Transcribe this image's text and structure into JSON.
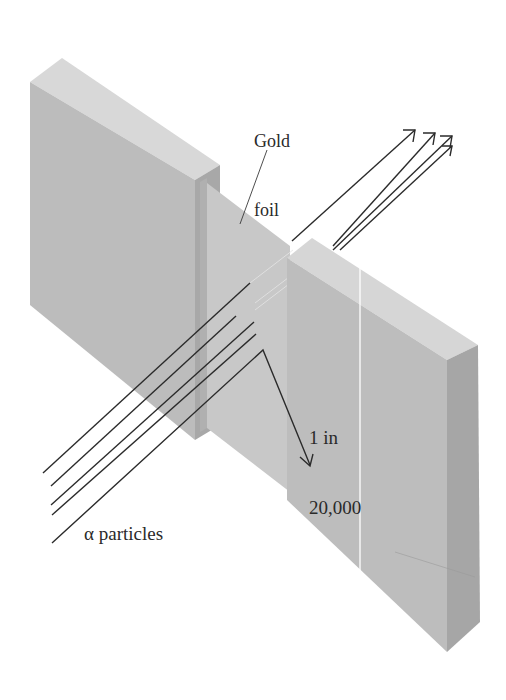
{
  "labels": {
    "gold_foil_line1": "Gold",
    "gold_foil_line2": "foil",
    "ratio_line1": "1 in",
    "ratio_line2": "20,000",
    "alpha": "α particles"
  },
  "colors": {
    "block_front": "#bdbdbd",
    "block_top": "#d6d6d6",
    "block_side": "#a9a9a9",
    "foil": "#c6c6c6",
    "lines": "#2b2b2b",
    "background": "#ffffff"
  },
  "elements": {
    "blocks": [
      "left-block",
      "right-block"
    ],
    "foil": "gold-foil",
    "particle_beams": 5,
    "transmitted_arrows": 4,
    "deflected_arrows": 1
  }
}
